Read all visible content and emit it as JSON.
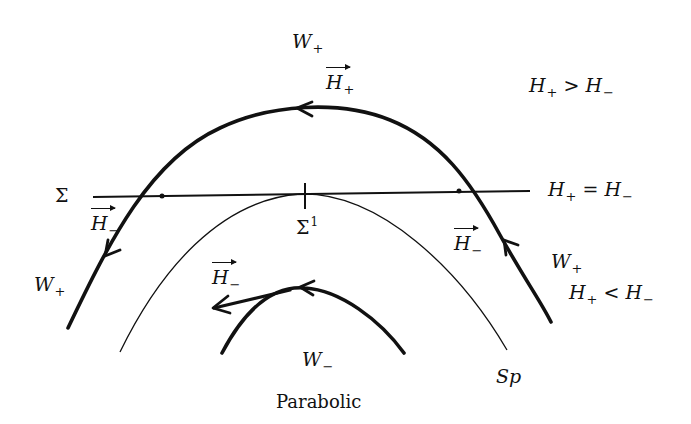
{
  "diagram": {
    "caption": "Parabolic",
    "regions": {
      "top": "W",
      "top_sub": "+",
      "left": "W",
      "left_sub": "+",
      "right": "W",
      "right_sub": "+",
      "inner": "W",
      "inner_sub": "−"
    },
    "conditions": {
      "greater": {
        "lhs": "H",
        "lhs_sub": "+",
        "op": ">",
        "rhs": "H",
        "rhs_sub": "−"
      },
      "equal": {
        "lhs": "H",
        "lhs_sub": "+",
        "op": "=",
        "rhs": "H",
        "rhs_sub": "−"
      },
      "less": {
        "lhs": "H",
        "lhs_sub": "+",
        "op": "<",
        "rhs": "H",
        "rhs_sub": "−"
      }
    },
    "surfaces": {
      "sigma": "Σ",
      "sigma1": "Σ",
      "sigma1_sup": "1",
      "sp": "Sp"
    },
    "vectors": {
      "top": {
        "base": "H",
        "sub": "+"
      },
      "left": {
        "base": "H",
        "sub": "−"
      },
      "right": {
        "base": "H",
        "sub": "−"
      },
      "inner": {
        "base": "H",
        "sub": "−"
      }
    },
    "stroke_color": "#111111",
    "background": "#ffffff"
  }
}
